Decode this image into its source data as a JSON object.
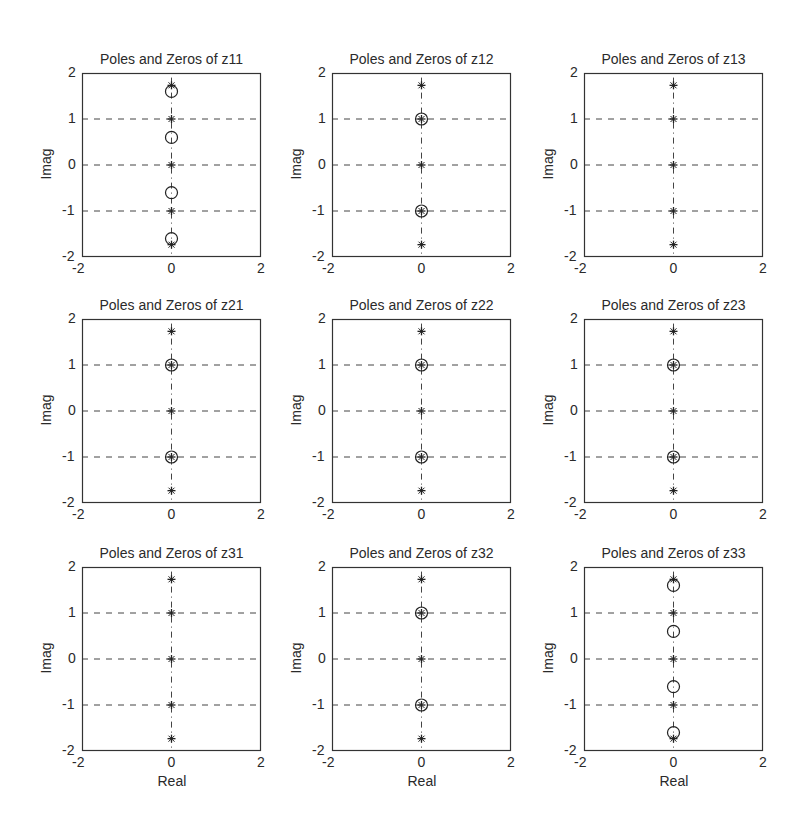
{
  "figure": {
    "layout": "3x3 subplot grid",
    "xlabel": "Real",
    "ylabel": "Imag"
  },
  "chart_data": [
    {
      "type": "scatter",
      "title": "Poles and Zeros of z11",
      "xlabel": "",
      "ylabel": "Imag",
      "xlim": [
        -2,
        2
      ],
      "ylim": [
        -2,
        2
      ],
      "xticks": [
        "-2",
        "0",
        "2"
      ],
      "yticks": [
        "2",
        "1",
        "0",
        "-1",
        "-2"
      ],
      "grid": "horizontal dashed",
      "poles": [
        [
          0,
          1.732
        ],
        [
          0,
          1
        ],
        [
          0,
          0
        ],
        [
          0,
          -1
        ],
        [
          0,
          -1.732
        ]
      ],
      "zeros": [
        [
          0,
          1.6
        ],
        [
          0,
          0.6
        ],
        [
          0,
          -0.6
        ],
        [
          0,
          -1.6
        ]
      ]
    },
    {
      "type": "scatter",
      "title": "Poles and Zeros of z12",
      "xlabel": "",
      "ylabel": "Imag",
      "xlim": [
        -2,
        2
      ],
      "ylim": [
        -2,
        2
      ],
      "xticks": [
        "-2",
        "0",
        "2"
      ],
      "yticks": [
        "2",
        "1",
        "0",
        "-1",
        "-2"
      ],
      "grid": "horizontal dashed",
      "poles": [
        [
          0,
          1.732
        ],
        [
          0,
          1
        ],
        [
          0,
          0
        ],
        [
          0,
          -1
        ],
        [
          0,
          -1.732
        ]
      ],
      "zeros": [
        [
          0,
          1
        ],
        [
          0,
          -1
        ]
      ]
    },
    {
      "type": "scatter",
      "title": "Poles and Zeros of z13",
      "xlabel": "",
      "ylabel": "Imag",
      "xlim": [
        -2,
        2
      ],
      "ylim": [
        -2,
        2
      ],
      "xticks": [
        "-2",
        "0",
        "2"
      ],
      "yticks": [
        "2",
        "1",
        "0",
        "-1",
        "-2"
      ],
      "grid": "horizontal dashed",
      "poles": [
        [
          0,
          1.732
        ],
        [
          0,
          1
        ],
        [
          0,
          0
        ],
        [
          0,
          -1
        ],
        [
          0,
          -1.732
        ]
      ],
      "zeros": []
    },
    {
      "type": "scatter",
      "title": "Poles and Zeros of z21",
      "xlabel": "",
      "ylabel": "Imag",
      "xlim": [
        -2,
        2
      ],
      "ylim": [
        -2,
        2
      ],
      "xticks": [
        "-2",
        "0",
        "2"
      ],
      "yticks": [
        "2",
        "1",
        "0",
        "-1",
        "-2"
      ],
      "grid": "horizontal dashed",
      "poles": [
        [
          0,
          1.732
        ],
        [
          0,
          1
        ],
        [
          0,
          0
        ],
        [
          0,
          -1
        ],
        [
          0,
          -1.732
        ]
      ],
      "zeros": [
        [
          0,
          1
        ],
        [
          0,
          -1
        ]
      ]
    },
    {
      "type": "scatter",
      "title": "Poles and Zeros of z22",
      "xlabel": "",
      "ylabel": "Imag",
      "xlim": [
        -2,
        2
      ],
      "ylim": [
        -2,
        2
      ],
      "xticks": [
        "-2",
        "0",
        "2"
      ],
      "yticks": [
        "2",
        "1",
        "0",
        "-1",
        "-2"
      ],
      "grid": "horizontal dashed",
      "poles": [
        [
          0,
          1.732
        ],
        [
          0,
          1
        ],
        [
          0,
          0
        ],
        [
          0,
          -1
        ],
        [
          0,
          -1.732
        ]
      ],
      "zeros": [
        [
          0,
          1
        ],
        [
          0,
          -1
        ]
      ]
    },
    {
      "type": "scatter",
      "title": "Poles and Zeros of z23",
      "xlabel": "",
      "ylabel": "Imag",
      "xlim": [
        -2,
        2
      ],
      "ylim": [
        -2,
        2
      ],
      "xticks": [
        "-2",
        "0",
        "2"
      ],
      "yticks": [
        "2",
        "1",
        "0",
        "-1",
        "-2"
      ],
      "grid": "horizontal dashed",
      "poles": [
        [
          0,
          1.732
        ],
        [
          0,
          1
        ],
        [
          0,
          0
        ],
        [
          0,
          -1
        ],
        [
          0,
          -1.732
        ]
      ],
      "zeros": [
        [
          0,
          1
        ],
        [
          0,
          -1
        ]
      ]
    },
    {
      "type": "scatter",
      "title": "Poles and Zeros of z31",
      "xlabel": "Real",
      "ylabel": "Imag",
      "xlim": [
        -2,
        2
      ],
      "ylim": [
        -2,
        2
      ],
      "xticks": [
        "-2",
        "0",
        "2"
      ],
      "yticks": [
        "2",
        "1",
        "0",
        "-1",
        "-2"
      ],
      "grid": "horizontal dashed",
      "poles": [
        [
          0,
          1.732
        ],
        [
          0,
          1
        ],
        [
          0,
          0
        ],
        [
          0,
          -1
        ],
        [
          0,
          -1.732
        ]
      ],
      "zeros": []
    },
    {
      "type": "scatter",
      "title": "Poles and Zeros of z32",
      "xlabel": "Real",
      "ylabel": "Imag",
      "xlim": [
        -2,
        2
      ],
      "ylim": [
        -2,
        2
      ],
      "xticks": [
        "-2",
        "0",
        "2"
      ],
      "yticks": [
        "2",
        "1",
        "0",
        "-1",
        "-2"
      ],
      "grid": "horizontal dashed",
      "poles": [
        [
          0,
          1.732
        ],
        [
          0,
          1
        ],
        [
          0,
          0
        ],
        [
          0,
          -1
        ],
        [
          0,
          -1.732
        ]
      ],
      "zeros": [
        [
          0,
          1
        ],
        [
          0,
          -1
        ]
      ]
    },
    {
      "type": "scatter",
      "title": "Poles and Zeros of z33",
      "xlabel": "Real",
      "ylabel": "Imag",
      "xlim": [
        -2,
        2
      ],
      "ylim": [
        -2,
        2
      ],
      "xticks": [
        "-2",
        "0",
        "2"
      ],
      "yticks": [
        "2",
        "1",
        "0",
        "-1",
        "-2"
      ],
      "grid": "horizontal dashed",
      "poles": [
        [
          0,
          1.732
        ],
        [
          0,
          1
        ],
        [
          0,
          0
        ],
        [
          0,
          -1
        ],
        [
          0,
          -1.732
        ]
      ],
      "zeros": [
        [
          0,
          1.6
        ],
        [
          0,
          0.6
        ],
        [
          0,
          -0.6
        ],
        [
          0,
          -1.6
        ]
      ]
    }
  ]
}
